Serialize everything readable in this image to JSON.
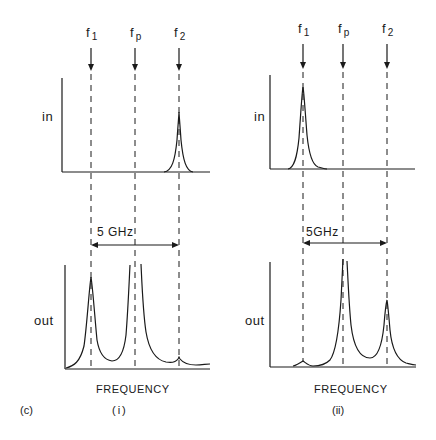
{
  "figure": {
    "panel_tag": "(c)",
    "panels": [
      {
        "id": "i",
        "caption": "(i)",
        "xlabel": "FREQUENCY",
        "markers": [
          {
            "main": "f",
            "sub": "1"
          },
          {
            "main": "f",
            "sub": "p"
          },
          {
            "main": "f",
            "sub": "2"
          }
        ],
        "input_label": "in",
        "output_label": "out",
        "spacing_label": "5 GHz"
      },
      {
        "id": "ii",
        "caption": "(ii)",
        "xlabel": "FREQUENCY",
        "markers": [
          {
            "main": "f",
            "sub": "1"
          },
          {
            "main": "f",
            "sub": "p"
          },
          {
            "main": "f",
            "sub": "2"
          }
        ],
        "input_label": "in",
        "output_label": "out",
        "spacing_label": "5GHz"
      }
    ]
  },
  "colors": {
    "ink": "#1a1a1a",
    "background": "#ffffff"
  }
}
